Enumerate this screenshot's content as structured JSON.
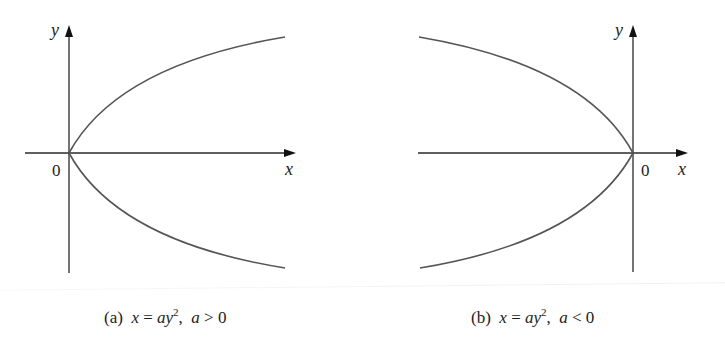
{
  "figure": {
    "panels": [
      {
        "id": "a",
        "caption_tag": "(a)",
        "equation_lhs": "x",
        "equation_eq": " = ",
        "equation_rhs_base": "ay",
        "equation_rhs_exp": "2",
        "condition_var": "a",
        "condition_op": " > ",
        "condition_val": "0",
        "origin_label": "0",
        "x_axis_label": "x",
        "y_axis_label": "y",
        "opens": "right"
      },
      {
        "id": "b",
        "caption_tag": "(b)",
        "equation_lhs": "x",
        "equation_eq": " = ",
        "equation_rhs_base": "ay",
        "equation_rhs_exp": "2",
        "condition_var": "a",
        "condition_op": " < ",
        "condition_val": "0",
        "origin_label": "0",
        "x_axis_label": "x",
        "y_axis_label": "y",
        "opens": "left"
      }
    ],
    "colors": {
      "axis": "#2a2a2a",
      "curve": "#555555",
      "text": "#222222"
    }
  }
}
